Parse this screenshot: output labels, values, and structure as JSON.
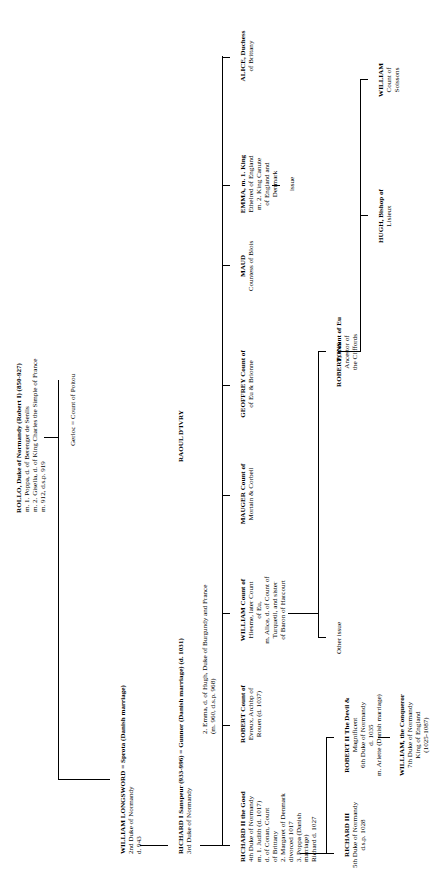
{
  "chart": {
    "type": "genealogy-tree",
    "orientation": "rotated-90-ccw"
  },
  "nodes": {
    "rollo": {
      "name": "ROLLO, Duke of Normandy (Robert I) (850-927)",
      "lines": "m. 1. Poppa, d. of Berenger de Senlis\nm. 2. Gisella, d. of King Charles the Simple of France\nm. 912, d.s.p. 919"
    },
    "gerloc": {
      "name": "Gerloc = Count of Poitou"
    },
    "william_longsword": {
      "name": "WILLIAM LONGSWORD = Sprota (Danish marriage)",
      "lines": "2nd Duke of Normandy\nd. 943",
      "spouse_line": "d. 943"
    },
    "richard_i": {
      "name": "RICHARD I Sanspeur (933-996) = Gunnor (Danish marriage) (d. 1031)",
      "lines": "3rd Duke of Normandy",
      "second": "2. Emma, d. of Hugh, Duke of Burgundy and France\n(m. 960, d.s.p. 968)"
    },
    "raoul": {
      "name": "RAOUL D'IVRY"
    },
    "richard_ii": {
      "name": "RICHARD II the Good",
      "lines": "4th Duke of Normandy\nm. 1. Judith (d. 1017)\n      d. of Conan, Count\n      of Brittany\n2. Margaret of Denmark\n   divorced 1017\n3. Poppa (Danish\n   marriage)\n            Richard d. 1027"
    },
    "robert_evreux": {
      "name": "ROBERT Count of",
      "lines": "Evreux, Archbp of\nRouen (d. 1037)"
    },
    "william_hiesme": {
      "name": "WILLIAM Count of",
      "lines": "Hiesme, later Count\nof Eu,\nm. Alice, d. of Count of\nTurquetil, and sister\nof Baron of Harcourt"
    },
    "mauger": {
      "name": "MAUGER Count of",
      "lines": "Mortain & Corbeil"
    },
    "geoffrey": {
      "name": "GEOFFREY Count of",
      "lines": "of Eu & Brionne"
    },
    "maud": {
      "name": "MAUD",
      "lines": "Countess of Blois"
    },
    "emma": {
      "name": "EMMA, m. 1. King",
      "lines": "Ethelred of England\nm. 2. King Canute\n      of England and\n      Denmark",
      "issue": "issue"
    },
    "alice": {
      "name": "ALICE, Duchess",
      "lines": "of Brittany"
    },
    "richard_iii": {
      "name": "RICHARD III",
      "lines": "5th Duke of Normandy\nd.s.p. 1028"
    },
    "robert_ii": {
      "name": "ROBERT II The Devil &",
      "lines": "Magnificent\n6th Duke of Normandy\nd. 1035\nm. Arlette (Danish marriage)"
    },
    "william_conqueror": {
      "name": "WILLIAM, the Conqueror",
      "lines": "7th Duke of Normandy\nKing of England\n(1025-1087)"
    },
    "other_issue": {
      "name": "Other issue"
    },
    "robert_eu": {
      "name": "ROBERT, Count of Eu"
    },
    "pons": {
      "name": "PONS",
      "lines": "Ancestor of\nthe Cliffords"
    },
    "hugh": {
      "name": "HUGH, Bishop of",
      "lines": "Lisieux"
    },
    "william_soissons": {
      "name": "WILLIAM",
      "lines": "Count of\nSoissons"
    }
  }
}
